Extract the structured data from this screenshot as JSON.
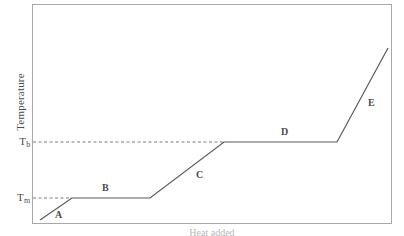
{
  "figure": {
    "background_color": "#ffffff",
    "line_color": "#595959",
    "frame_color": "#a8a8a8",
    "dash_color": "#7a7a7a",
    "text_color": "#4b4b4b"
  },
  "axes": {
    "y_title": "Temperature",
    "x_title": "Heat added",
    "y_ticks": [
      {
        "name": "boiling-point",
        "text_main": "T",
        "text_sub": "b",
        "pixel_y": 142
      },
      {
        "name": "melting-point",
        "text_main": "T",
        "text_sub": "m",
        "pixel_y": 198
      }
    ]
  },
  "segment_labels": [
    {
      "id": "A",
      "label": "A"
    },
    {
      "id": "B",
      "label": "B"
    },
    {
      "id": "C",
      "label": "C"
    },
    {
      "id": "D",
      "label": "D"
    },
    {
      "id": "E",
      "label": "E"
    }
  ],
  "chart_data": {
    "type": "line",
    "title": "",
    "xlabel": "Heat added",
    "ylabel": "Temperature",
    "grid": false,
    "legend": null,
    "axis_ticks_x": [],
    "axis_ticks_y": [
      "T_m",
      "T_b"
    ],
    "annotations": [
      {
        "text": "A",
        "x": 56,
        "y": 210,
        "meaning": "solid heating"
      },
      {
        "text": "B",
        "x": 110,
        "y": 198,
        "meaning": "melting plateau"
      },
      {
        "text": "C",
        "x": 187,
        "y": 170,
        "meaning": "liquid heating"
      },
      {
        "text": "D",
        "x": 280,
        "y": 142,
        "meaning": "boiling plateau"
      },
      {
        "text": "E",
        "x": 362,
        "y": 95,
        "meaning": "gas heating"
      }
    ],
    "series": [
      {
        "name": "heating curve",
        "points": [
          {
            "x": 40,
            "y": 220
          },
          {
            "x": 72,
            "y": 198
          },
          {
            "x": 150,
            "y": 198
          },
          {
            "x": 224,
            "y": 142
          },
          {
            "x": 337,
            "y": 142
          },
          {
            "x": 388,
            "y": 48
          }
        ],
        "polyline": "40,220 72,198 150,198 224,142 337,142 388,48"
      }
    ],
    "guide_lines": [
      {
        "name": "tb-dashed-guide",
        "y": 142,
        "x_start": 33,
        "x_end": 224
      },
      {
        "name": "tm-dashed-guide",
        "y": 198,
        "x_start": 33,
        "x_end": 72
      }
    ],
    "plot_frame": {
      "left": 32,
      "top": 4,
      "right": 392,
      "bottom": 224
    }
  }
}
